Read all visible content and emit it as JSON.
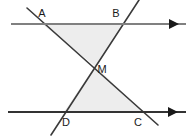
{
  "figure": {
    "width": 194,
    "height": 138,
    "background_color": "#ffffff",
    "colors": {
      "top_parallel_line": "#808080",
      "bottom_parallel_line": "#333333",
      "transversal": "#3a3a3a",
      "triangle_fill": "#ededed",
      "label_text": "#1a1a1a",
      "arrow_head": "#1a1a1a"
    },
    "labels": [
      {
        "name": "A",
        "text": "A",
        "x": 42,
        "y": 14
      },
      {
        "name": "B",
        "text": "B",
        "x": 116,
        "y": 14
      },
      {
        "name": "M",
        "text": "M",
        "x": 102,
        "y": 70
      },
      {
        "name": "D",
        "text": "D",
        "x": 66,
        "y": 123
      },
      {
        "name": "C",
        "text": "C",
        "x": 138,
        "y": 123
      }
    ],
    "points": {
      "A": {
        "x": 42,
        "y": 24
      },
      "B": {
        "x": 122,
        "y": 24
      },
      "M": {
        "x": 95,
        "y": 66
      },
      "D": {
        "x": 64,
        "y": 112
      },
      "C": {
        "x": 143,
        "y": 112
      }
    },
    "lines": {
      "top_parallel": {
        "x1": 11,
        "y1": 24,
        "x2": 186,
        "y2": 24,
        "arrow": "right",
        "stroke_width": 2
      },
      "bottom_parallel": {
        "x1": 8,
        "y1": 112,
        "x2": 186,
        "y2": 112,
        "arrow": "right",
        "stroke_width": 2
      },
      "transversal_AC": {
        "x1": 27,
        "y1": 8,
        "x2": 158,
        "y2": 125,
        "stroke_width": 1.6
      },
      "transversal_BD": {
        "x1": 139,
        "y1": 0,
        "x2": 51,
        "y2": 135,
        "stroke_width": 1.6
      }
    },
    "triangles": [
      {
        "name": "upper-triangle-ABM",
        "vertices": "42,24 122,24 95,66",
        "fill": "#ededed"
      },
      {
        "name": "lower-triangle-DCM",
        "vertices": "64,112 143,112 95,66",
        "fill": "#ededed"
      }
    ]
  }
}
